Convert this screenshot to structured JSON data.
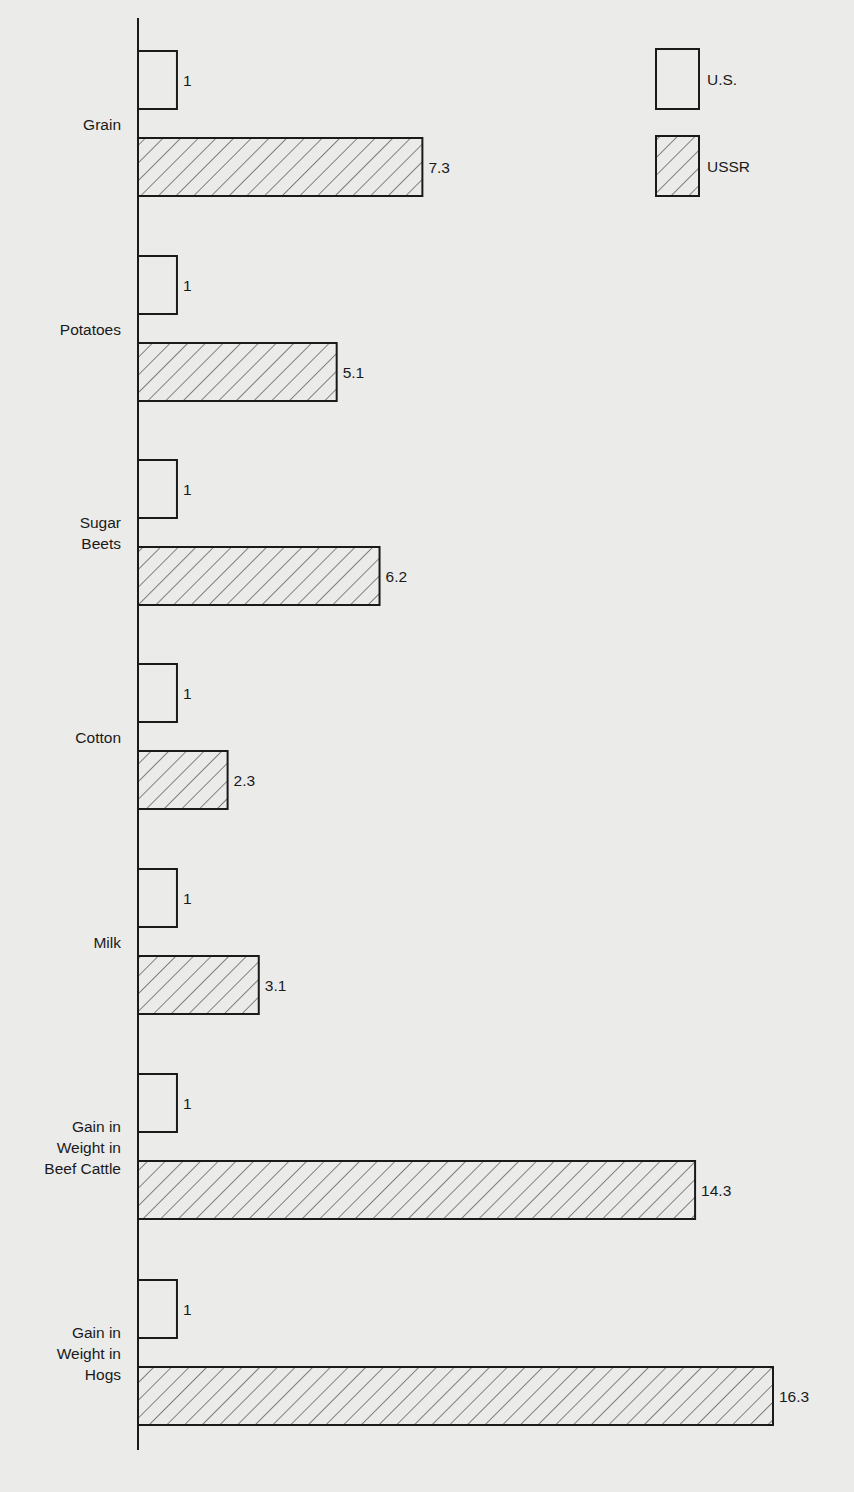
{
  "chart_data": {
    "type": "bar",
    "orientation": "horizontal",
    "title": "",
    "xlabel": "",
    "ylabel": "",
    "grid": false,
    "legend_position": "top-right",
    "categories": [
      [
        "Grain"
      ],
      [
        "Potatoes"
      ],
      [
        "Sugar",
        "Beets"
      ],
      [
        "Cotton"
      ],
      [
        "Milk"
      ],
      [
        "Gain in",
        "Weight in",
        "Beef Cattle"
      ],
      [
        "Gain in",
        "Weight in",
        "Hogs"
      ]
    ],
    "category_names": [
      "Grain",
      "Potatoes",
      "Sugar Beets",
      "Cotton",
      "Milk",
      "Gain in Weight in Beef Cattle",
      "Gain in Weight in Hogs"
    ],
    "series": [
      {
        "name": "U.S.",
        "pattern": "empty",
        "values": [
          1,
          1,
          1,
          1,
          1,
          1,
          1
        ],
        "labels": [
          "1",
          "1",
          "1",
          "1",
          "1",
          "1",
          "1"
        ]
      },
      {
        "name": "USSR",
        "pattern": "diagonal-hatch",
        "values": [
          7.3,
          5.1,
          6.2,
          2.3,
          3.1,
          14.3,
          16.3
        ],
        "labels": [
          "7.3",
          "5.1",
          "6.2",
          "2.3",
          "3.1",
          "14.3",
          "16.3"
        ]
      }
    ],
    "colors": {
      "stroke": "#1a1a1a",
      "background": "#ebebea",
      "fill": "#ebebea"
    }
  },
  "legend": {
    "items": [
      {
        "label": "U.S.",
        "pattern": "empty"
      },
      {
        "label": "USSR",
        "pattern": "diagonal-hatch"
      }
    ]
  }
}
